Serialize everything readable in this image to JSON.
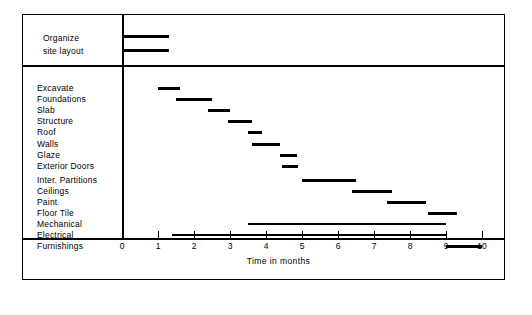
{
  "chart_data": {
    "type": "bar",
    "chart_style": "gantt",
    "title": "",
    "xlabel": "Time in months",
    "ylabel": "",
    "xlim": [
      0,
      10
    ],
    "xticks": [
      0,
      1,
      2,
      3,
      4,
      5,
      6,
      7,
      8,
      9,
      10
    ],
    "grid": false,
    "legend": false,
    "units": "months",
    "header_section": {
      "label_line1": "Organize",
      "label_line2": "site layout",
      "bars": [
        {
          "name": "Organize",
          "start": 0,
          "end": 1.3
        },
        {
          "name": "site layout",
          "start": 0,
          "end": 1.3
        }
      ]
    },
    "categories": [
      "Excavate",
      "Foundations",
      "Slab",
      "Structure",
      "Roof",
      "Walls",
      "Glaze",
      "Exterior Doors",
      "Inter. Partitions",
      "Ceilings",
      "Paint",
      "Floor Tile",
      "Mechanical",
      "Electrical",
      "Furnishings"
    ],
    "tasks": [
      {
        "label": "Excavate",
        "start": 1.0,
        "end": 1.6,
        "weight": "thick"
      },
      {
        "label": "Foundations",
        "start": 1.5,
        "end": 2.5,
        "weight": "thick"
      },
      {
        "label": "Slab",
        "start": 2.4,
        "end": 3.0,
        "weight": "thick"
      },
      {
        "label": "Structure",
        "start": 2.95,
        "end": 3.6,
        "weight": "thick"
      },
      {
        "label": "Roof",
        "start": 3.5,
        "end": 3.9,
        "weight": "thick"
      },
      {
        "label": "Walls",
        "start": 3.6,
        "end": 4.4,
        "weight": "thick"
      },
      {
        "label": "Glaze",
        "start": 4.4,
        "end": 4.85,
        "weight": "thick"
      },
      {
        "label": "Exterior Doors",
        "start": 4.45,
        "end": 4.9,
        "weight": "thick"
      },
      {
        "label": "Inter. Partitions",
        "start": 5.0,
        "end": 6.5,
        "weight": "thick"
      },
      {
        "label": "Ceilings",
        "start": 6.4,
        "end": 7.5,
        "weight": "thick"
      },
      {
        "label": "Paint",
        "start": 7.35,
        "end": 8.45,
        "weight": "thick"
      },
      {
        "label": "Floor Tile",
        "start": 8.5,
        "end": 9.3,
        "weight": "thick"
      },
      {
        "label": "Mechanical",
        "start": 3.5,
        "end": 9.0,
        "weight": "thin"
      },
      {
        "label": "Electrical",
        "start": 1.4,
        "end": 9.0,
        "weight": "thin"
      },
      {
        "label": "Furnishings",
        "start": 9.0,
        "end": 10.0,
        "weight": "thick"
      }
    ]
  },
  "axis": {
    "caption": "Time in months",
    "tick_labels": [
      "0",
      "1",
      "2",
      "3",
      "4",
      "5",
      "6",
      "7",
      "8",
      "9",
      "10"
    ]
  },
  "colors": {
    "bar": "#000000",
    "frame": "#000000",
    "background": "#ffffff"
  }
}
